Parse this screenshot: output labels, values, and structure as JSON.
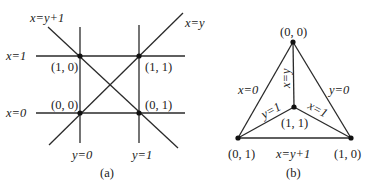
{
  "panel_a": {
    "caption": "(a)",
    "line_labels": {
      "x_eq_y_plus_1": "x=y+1",
      "x_eq_y": "x=y",
      "x_eq_1": "x=1",
      "x_eq_0": "x=0",
      "y_eq_0": "y=0",
      "y_eq_1": "y=1"
    },
    "points": [
      {
        "label": "(1, 0)"
      },
      {
        "label": "(1, 1)"
      },
      {
        "label": "(0, 0)"
      },
      {
        "label": "(0, 1)"
      }
    ]
  },
  "panel_b": {
    "caption": "(b)",
    "edge_labels": {
      "x_eq_0": "x=0",
      "y_eq_0": "y=0",
      "x_eq_y": "x=y",
      "y_eq_1": "y=1",
      "x_eq_1": "x=1",
      "x_eq_y_plus_1": "x=y+1"
    },
    "points": [
      {
        "label": "(0, 0)"
      },
      {
        "label": "(1, 1)"
      },
      {
        "label": "(0, 1)"
      },
      {
        "label": "(1, 0)"
      }
    ]
  }
}
